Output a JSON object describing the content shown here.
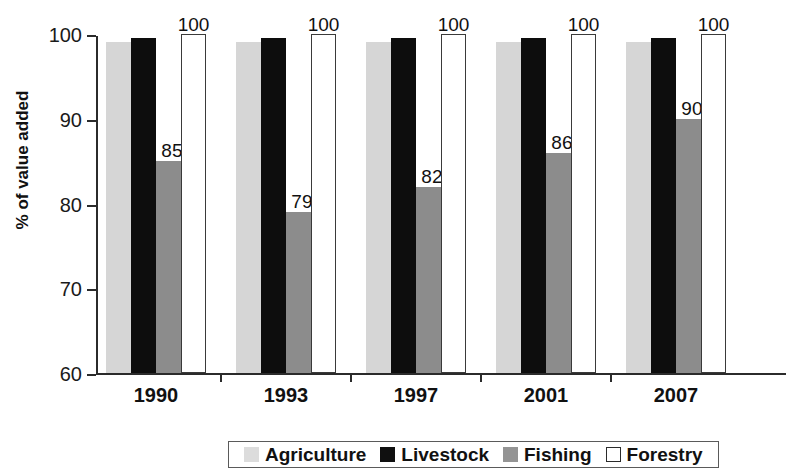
{
  "chart_data": {
    "type": "bar",
    "title": "",
    "subtitle": "",
    "xlabel": "",
    "ylabel": "% of value added",
    "categories": [
      "1990",
      "1993",
      "1997",
      "2001",
      "2007"
    ],
    "ylim": [
      60,
      100
    ],
    "yticks": [
      60,
      70,
      80,
      90,
      100
    ],
    "ytick_labels": [
      "60",
      "70",
      "80",
      "90",
      "100"
    ],
    "grid": false,
    "legend_position": "bottom",
    "series": [
      {
        "name": "Agriculture",
        "color": "#d6d6d6",
        "values": [
          99,
          99,
          99,
          99,
          99
        ],
        "labels": [
          "",
          "",
          "",
          "",
          ""
        ]
      },
      {
        "name": "Livestock",
        "color": "#0d0d0d",
        "values": [
          99.5,
          99.5,
          99.5,
          99.5,
          99.5
        ],
        "labels": [
          "",
          "",
          "",
          "",
          ""
        ]
      },
      {
        "name": "Fishing",
        "color": "#8c8c8c",
        "values": [
          85,
          79,
          82,
          86,
          90
        ],
        "labels": [
          "85",
          "79",
          "82",
          "86",
          "90"
        ]
      },
      {
        "name": "Forestry",
        "color": "#ffffff",
        "values": [
          100,
          100,
          100,
          100,
          100
        ],
        "labels": [
          "100",
          "100",
          "100",
          "100",
          "100"
        ]
      }
    ]
  },
  "legend": {
    "items": [
      {
        "label": "Agriculture"
      },
      {
        "label": "Livestock"
      },
      {
        "label": "Fishing"
      },
      {
        "label": "Forestry"
      }
    ]
  }
}
